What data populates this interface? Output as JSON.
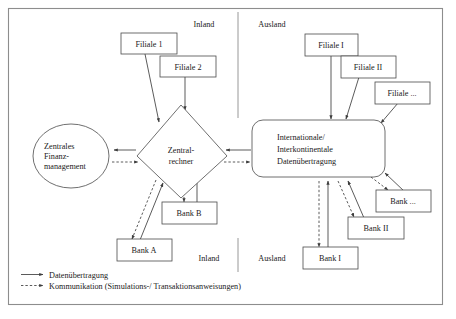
{
  "figure": {
    "type": "block-diagram",
    "region_labels": {
      "top_left": "Inland",
      "top_right": "Ausland",
      "bottom_left": "Inland",
      "bottom_right": "Ausland"
    },
    "nodes": {
      "central_finance": {
        "lines": [
          "Zentrales",
          "Finanz-",
          "management"
        ],
        "shape": "ellipse"
      },
      "central_computer": {
        "lines": [
          "Zentral-",
          "rechner"
        ],
        "shape": "diamond"
      },
      "international_transfer": {
        "lines": [
          "Internationale/",
          "Interkontinentale",
          "Datenübertragung"
        ],
        "shape": "rounded-rect"
      },
      "branch_dom_1": {
        "label": "Filiale 1",
        "shape": "rect"
      },
      "branch_dom_2": {
        "label": "Filiale 2",
        "shape": "rect"
      },
      "branch_for_1": {
        "label": "Filiale I",
        "shape": "rect"
      },
      "branch_for_2": {
        "label": "Filiale II",
        "shape": "rect"
      },
      "branch_for_n": {
        "label": "Filiale ...",
        "shape": "rect"
      },
      "bank_a": {
        "label": "Bank A",
        "shape": "rect"
      },
      "bank_b": {
        "label": "Bank B",
        "shape": "rect"
      },
      "bank_i": {
        "label": "Bank I",
        "shape": "rect"
      },
      "bank_ii": {
        "label": "Bank II",
        "shape": "rect"
      },
      "bank_n": {
        "label": "Bank ...",
        "shape": "rect"
      }
    },
    "legend": [
      {
        "style": "solid",
        "label": "Datenübertragung"
      },
      {
        "style": "dashed",
        "label": "Kommunikation (Simulations-/ Transaktionsanweisungen)"
      }
    ],
    "colors": {
      "frame": "#8d8d8d",
      "shape_stroke": "#4a4a4a",
      "edge": "#3d3d3d",
      "text": "#1a1a1a",
      "background": "#ffffff"
    }
  }
}
